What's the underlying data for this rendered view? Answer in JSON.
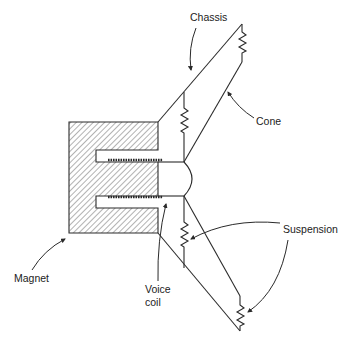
{
  "diagram": {
    "labels": {
      "chassis": "Chassis",
      "cone": "Cone",
      "suspension": "Suspension",
      "magnet": "Magnet",
      "voice_coil_line1": "Voice",
      "voice_coil_line2": "coil"
    },
    "colors": {
      "line": "#2a2a2a",
      "text": "#222222",
      "background": "#ffffff"
    }
  }
}
